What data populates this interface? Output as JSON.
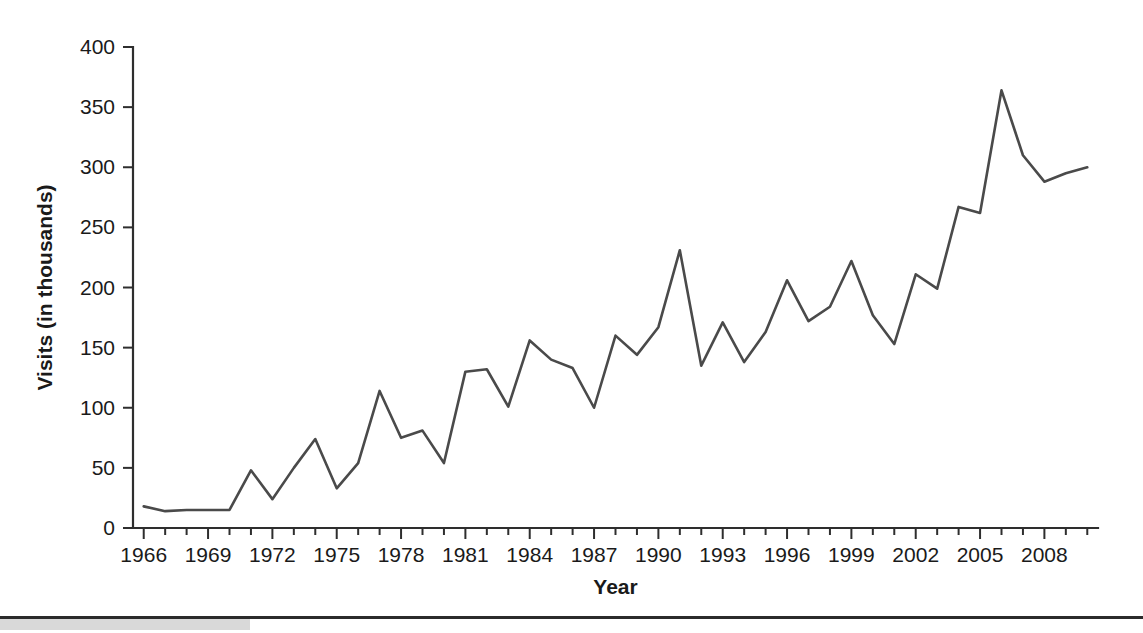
{
  "chart_data": {
    "type": "line",
    "title": "",
    "xlabel": "Year",
    "ylabel": "Visits (in thousands)",
    "xlim": [
      1965.5,
      2010.5
    ],
    "ylim": [
      0,
      400
    ],
    "yticks": [
      0,
      50,
      100,
      150,
      200,
      250,
      300,
      350,
      400
    ],
    "ytick_labels": [
      "0",
      "50",
      "100",
      "150",
      "200",
      "250",
      "300",
      "350",
      "400"
    ],
    "xtick_labels": [
      "1966",
      "1969",
      "1972",
      "1975",
      "1978",
      "1981",
      "1984",
      "1987",
      "1990",
      "1993",
      "1996",
      "1999",
      "2002",
      "2005",
      "2008"
    ],
    "xtick_label_values": [
      1966,
      1969,
      1972,
      1975,
      1978,
      1981,
      1984,
      1987,
      1990,
      1993,
      1996,
      1999,
      2002,
      2005,
      2008
    ],
    "xtick_minor_values": [
      1966,
      1967,
      1968,
      1969,
      1970,
      1971,
      1972,
      1973,
      1974,
      1975,
      1976,
      1977,
      1978,
      1979,
      1980,
      1981,
      1982,
      1983,
      1984,
      1985,
      1986,
      1987,
      1988,
      1989,
      1990,
      1991,
      1992,
      1993,
      1994,
      1995,
      1996,
      1997,
      1998,
      1999,
      2000,
      2001,
      2002,
      2003,
      2004,
      2005,
      2006,
      2007,
      2008,
      2009,
      2010
    ],
    "grid": false,
    "legend": false,
    "line_color": "#4a4a4a",
    "axis_color": "#2e2e2e",
    "x": [
      1966,
      1967,
      1968,
      1969,
      1970,
      1971,
      1972,
      1973,
      1974,
      1975,
      1976,
      1977,
      1978,
      1979,
      1980,
      1981,
      1982,
      1983,
      1984,
      1985,
      1986,
      1987,
      1988,
      1989,
      1990,
      1991,
      1992,
      1993,
      1994,
      1995,
      1996,
      1997,
      1998,
      1999,
      2000,
      2001,
      2002,
      2003,
      2004,
      2005,
      2006,
      2007,
      2008,
      2009,
      2010
    ],
    "values": [
      18,
      14,
      15,
      15,
      15,
      48,
      24,
      50,
      74,
      33,
      54,
      114,
      75,
      81,
      54,
      130,
      132,
      101,
      156,
      140,
      133,
      100,
      160,
      144,
      167,
      231,
      135,
      171,
      138,
      163,
      206,
      172,
      184,
      222,
      177,
      153,
      211,
      199,
      267,
      262,
      364,
      310,
      288,
      295,
      300
    ]
  },
  "footer": {
    "rule_visible": true,
    "band_visible": true
  }
}
